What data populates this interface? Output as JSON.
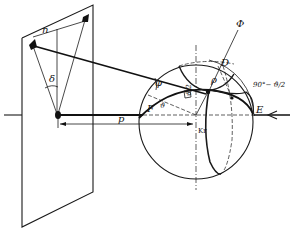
{
  "figure": {
    "colors": {
      "ink": "#111111",
      "background": "#ffffff"
    }
  },
  "labels": {
    "n": "n",
    "delta": "δ",
    "p": "p",
    "F": "F",
    "E": "E",
    "D": "D",
    "Kr": "Kr",
    "phi": "φ",
    "rho": "ρ",
    "theta_e": "ϑ",
    "half_angle": "ϑ/2",
    "complement": "90°− ϑ/2",
    "axis_symbol": "Ф"
  }
}
